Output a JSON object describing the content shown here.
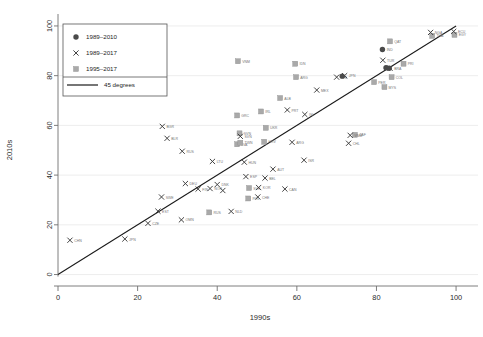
{
  "chart_data": {
    "type": "scatter",
    "title": "",
    "subtitle": "",
    "xlabel": "1990s",
    "ylabel": "2010s",
    "xlim": [
      0,
      104
    ],
    "ylim": [
      -3,
      104
    ],
    "xticks": [
      0,
      20,
      40,
      60,
      80,
      100
    ],
    "yticks": [
      0,
      20,
      40,
      60,
      80,
      100
    ],
    "grid": "horizontal",
    "legend_position": "top-left",
    "reference_line": {
      "label": "45 degrees",
      "slope": 1,
      "intercept": 0,
      "from": [
        0,
        0
      ],
      "to": [
        100,
        100
      ]
    },
    "legend": [
      {
        "label": "1989–2010",
        "marker": "circle"
      },
      {
        "label": "1989–2017",
        "marker": "x"
      },
      {
        "label": "1995–2017",
        "marker": "square"
      },
      {
        "label": "45 degrees",
        "marker": "line"
      }
    ],
    "series": [
      {
        "name": "1989–2010",
        "marker": "circle",
        "color": "#4a4a4a",
        "points": [
          {
            "label": "IND",
            "x": 81.5,
            "y": 90.5
          },
          {
            "label": "",
            "x": 82.4,
            "y": 83.2
          },
          {
            "label": "",
            "x": 83.2,
            "y": 83.0
          },
          {
            "label": "",
            "x": 71.4,
            "y": 79.8
          }
        ]
      },
      {
        "name": "1989–2017",
        "marker": "x",
        "color": "#3a3a3a",
        "points": [
          {
            "label": "CHN",
            "x": 3.0,
            "y": 13.8
          },
          {
            "label": "JPN",
            "x": 16.8,
            "y": 14.3
          },
          {
            "label": "CZE",
            "x": 22.6,
            "y": 20.6
          },
          {
            "label": "EST",
            "x": 25.1,
            "y": 25.5
          },
          {
            "label": "OMN",
            "x": 31.0,
            "y": 22.0
          },
          {
            "label": "SWE",
            "x": 26.0,
            "y": 31.2
          },
          {
            "label": "BGR",
            "x": 26.2,
            "y": 59.6
          },
          {
            "label": "BLR",
            "x": 27.4,
            "y": 54.8
          },
          {
            "label": "RUS",
            "x": 31.2,
            "y": 49.6
          },
          {
            "label": "DEU",
            "x": 32.0,
            "y": 36.6
          },
          {
            "label": "LTU",
            "x": 38.8,
            "y": 45.5
          },
          {
            "label": "FIN",
            "x": 35.2,
            "y": 34.4
          },
          {
            "label": "NOR",
            "x": 38.2,
            "y": 34.6
          },
          {
            "label": "DNK",
            "x": 40.0,
            "y": 36.2
          },
          {
            "label": "",
            "x": 41.4,
            "y": 33.8
          },
          {
            "label": "NLD",
            "x": 43.5,
            "y": 25.4
          },
          {
            "label": "HUN",
            "x": 46.8,
            "y": 45.2
          },
          {
            "label": "SVN",
            "x": 45.8,
            "y": 55.6
          },
          {
            "label": "ESP",
            "x": 47.2,
            "y": 39.4
          },
          {
            "label": "KOR",
            "x": 50.4,
            "y": 35.0
          },
          {
            "label": "CHE",
            "x": 50.2,
            "y": 31.2
          },
          {
            "label": "BEL",
            "x": 52.0,
            "y": 38.8
          },
          {
            "label": "AUT",
            "x": 54.0,
            "y": 42.4
          },
          {
            "label": "ARG",
            "x": 58.8,
            "y": 53.2
          },
          {
            "label": "CAN",
            "x": 57.0,
            "y": 34.4
          },
          {
            "label": "PRT",
            "x": 57.6,
            "y": 66.2
          },
          {
            "label": "ISR",
            "x": 61.8,
            "y": 46.0
          },
          {
            "label": "ISL",
            "x": 62.0,
            "y": 64.4
          },
          {
            "label": "MEX",
            "x": 65.0,
            "y": 74.2
          },
          {
            "label": "PHL",
            "x": 70.0,
            "y": 79.4
          },
          {
            "label": "JPN2",
            "x": 72.0,
            "y": 80.0
          },
          {
            "label": "VNM",
            "x": 73.4,
            "y": 56.0
          },
          {
            "label": "CHL",
            "x": 73.0,
            "y": 52.8
          },
          {
            "label": "TUR",
            "x": 81.6,
            "y": 86.2
          },
          {
            "label": "BRA",
            "x": 83.4,
            "y": 83.0
          },
          {
            "label": "NGA",
            "x": 93.6,
            "y": 97.4
          },
          {
            "label": "ECU",
            "x": 99.4,
            "y": 97.8
          }
        ]
      },
      {
        "name": "1995–2017",
        "marker": "square",
        "color": "#a9a9a9",
        "points": [
          {
            "label": "RUS",
            "x": 38.0,
            "y": 25.0
          },
          {
            "label": "POL",
            "x": 47.8,
            "y": 30.6
          },
          {
            "label": "SVK",
            "x": 48.0,
            "y": 34.8
          },
          {
            "label": "LVA",
            "x": 45.0,
            "y": 52.4
          },
          {
            "label": "SVN2",
            "x": 45.6,
            "y": 56.8
          },
          {
            "label": "TWN",
            "x": 45.8,
            "y": 53.0
          },
          {
            "label": "HRV",
            "x": 51.8,
            "y": 53.4
          },
          {
            "label": "UKR",
            "x": 52.2,
            "y": 59.0
          },
          {
            "label": "IRL",
            "x": 51.0,
            "y": 65.6
          },
          {
            "label": "GRC",
            "x": 45.0,
            "y": 64.0
          },
          {
            "label": "ALB",
            "x": 55.8,
            "y": 71.0
          },
          {
            "label": "ARG2",
            "x": 59.8,
            "y": 79.4
          },
          {
            "label": "VNM2",
            "x": 45.2,
            "y": 85.8
          },
          {
            "label": "IDN",
            "x": 59.6,
            "y": 84.8
          },
          {
            "label": "QAT",
            "x": 83.4,
            "y": 93.8
          },
          {
            "label": "PRI",
            "x": 86.8,
            "y": 84.8
          },
          {
            "label": "PER",
            "x": 79.4,
            "y": 77.4
          },
          {
            "label": "COL",
            "x": 83.8,
            "y": 79.4
          },
          {
            "label": "MYS",
            "x": 82.0,
            "y": 75.4
          },
          {
            "label": "ZAF",
            "x": 74.6,
            "y": 56.2
          },
          {
            "label": "THA",
            "x": 94.0,
            "y": 96.0
          },
          {
            "label": "EGY",
            "x": 99.6,
            "y": 96.4
          }
        ]
      }
    ]
  },
  "axes": {
    "xlabel": "1990s",
    "ylabel": "2010s",
    "xtick_labels": [
      "0",
      "20",
      "40",
      "60",
      "80",
      "100"
    ],
    "ytick_labels": [
      "0",
      "20",
      "40",
      "60",
      "80",
      "100"
    ]
  },
  "colors": {
    "circle_marker": "#4a4a4a",
    "x_marker": "#3a3a3a",
    "square_marker": "#a9a9a9",
    "reference_line": "#1a1a1a",
    "grid": "#e9e9e9",
    "axis": "#6f6f6f"
  }
}
